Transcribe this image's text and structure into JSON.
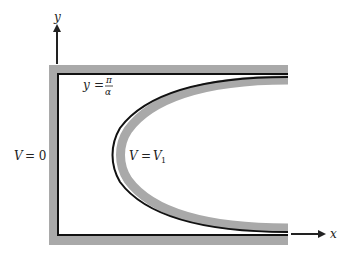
{
  "figure": {
    "axes": {
      "y_label": "y",
      "x_label": "x"
    },
    "labels": {
      "boundary_top": {
        "lhs": "y",
        "eq": "=",
        "numerator": "π",
        "denominator": "α"
      },
      "left_plate": {
        "lhs": "V",
        "eq": "= 0"
      },
      "curved_electrode": {
        "lhs": "V",
        "eq": "=",
        "rhs": "V",
        "rhs_sub": "1"
      }
    },
    "colors": {
      "line": "#111111",
      "band": "#a9a9a9",
      "background": "#ffffff"
    }
  }
}
